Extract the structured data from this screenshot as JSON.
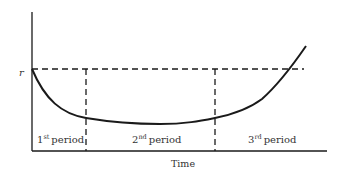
{
  "diagram": {
    "y_axis_label": "r",
    "x_axis_label": "Time",
    "periods": [
      {
        "base": "1",
        "sup": "st",
        "label": "period"
      },
      {
        "base": "2",
        "sup": "nd",
        "label": "period"
      },
      {
        "base": "3",
        "sup": "rd",
        "label": "period"
      }
    ],
    "colors": {
      "line": "#1a1a1a",
      "text": "#333333"
    }
  }
}
